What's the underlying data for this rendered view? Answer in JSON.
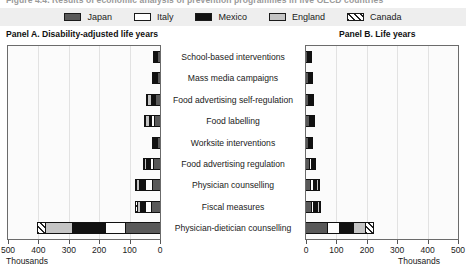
{
  "figure": {
    "title_fragment": "Figure 4.4. Results of economic analysis of prevention programmes in five OECD countries"
  },
  "legend": {
    "items": [
      {
        "label": "Japan",
        "swatch": "sw-japan",
        "color": "#595959"
      },
      {
        "label": "Italy",
        "swatch": "sw-italy",
        "color": "#ffffff"
      },
      {
        "label": "Mexico",
        "swatch": "sw-mexico",
        "color": "#111111"
      },
      {
        "label": "England",
        "swatch": "sw-england",
        "color": "#c4c4c4"
      },
      {
        "label": "Canada",
        "swatch": "sw-canada",
        "color": "#ffffff"
      }
    ]
  },
  "panels": {
    "a": {
      "title": "Panel A. Disability-adjusted life years",
      "units": "Thousands"
    },
    "b": {
      "title": "Panel B. Life years",
      "units": "Thousands"
    }
  },
  "chart_data": {
    "type": "bar",
    "title": "Results of economic analysis of prevention programmes",
    "orientation": "horizontal",
    "stacked": true,
    "legend_position": "top",
    "grid": true,
    "series_names": [
      "Japan",
      "Italy",
      "Mexico",
      "England",
      "Canada"
    ],
    "series_colors": [
      "#595959",
      "#ffffff",
      "#111111",
      "#c4c4c4",
      "#ffffff"
    ],
    "categories": [
      "School-based interventions",
      "Mass media campaigns",
      "Food advertising self-regulation",
      "Food labelling",
      "Worksite interventions",
      "Food advertising regulation",
      "Physician counselling",
      "Fiscal measures",
      "Physician-dietician counselling"
    ],
    "panels": [
      {
        "key": "a",
        "title": "Panel A. Disability-adjusted life years",
        "xlabel": "Thousands",
        "ylabel": "",
        "xlim": [
          0,
          500
        ],
        "x_direction": "right-to-left",
        "ticks": [
          500,
          400,
          300,
          200,
          100,
          0
        ],
        "series": [
          {
            "name": "Japan",
            "values": [
              12,
              14,
              20,
              22,
              14,
              26,
              30,
              34,
              120
            ]
          },
          {
            "name": "Italy",
            "values": [
              3,
              5,
              6,
              14,
              5,
              12,
              26,
              22,
              68
            ]
          },
          {
            "name": "Mexico",
            "values": [
              5,
              8,
              14,
              10,
              8,
              17,
              22,
              20,
              112
            ]
          },
          {
            "name": "England",
            "values": [
              4,
              6,
              16,
              18,
              6,
              12,
              14,
              14,
              90
            ]
          },
          {
            "name": "Canada",
            "values": [
              2,
              3,
              4,
              6,
              3,
              6,
              8,
              8,
              32
            ]
          }
        ],
        "totals": [
          26,
          36,
          60,
          70,
          36,
          73,
          100,
          98,
          422
        ]
      },
      {
        "key": "b",
        "title": "Panel B. Life years",
        "xlabel": "Thousands",
        "ylabel": "",
        "xlim": [
          0,
          500
        ],
        "x_direction": "left-to-right",
        "ticks": [
          0,
          100,
          200,
          300,
          400,
          500
        ],
        "series": [
          {
            "name": "Japan",
            "values": [
              10,
              12,
              14,
              16,
              12,
              18,
              20,
              22,
              75
            ]
          },
          {
            "name": "Italy",
            "values": [
              2,
              4,
              5,
              8,
              4,
              8,
              12,
              12,
              42
            ]
          },
          {
            "name": "Mexico",
            "values": [
              4,
              6,
              8,
              8,
              6,
              10,
              14,
              14,
              52
            ]
          },
          {
            "name": "England",
            "values": [
              3,
              4,
              6,
              8,
              5,
              8,
              10,
              10,
              42
            ]
          },
          {
            "name": "Canada",
            "values": [
              1,
              2,
              2,
              3,
              2,
              3,
              4,
              4,
              28
            ]
          }
        ],
        "totals": [
          20,
          28,
          35,
          43,
          29,
          47,
          60,
          62,
          239
        ]
      }
    ]
  }
}
